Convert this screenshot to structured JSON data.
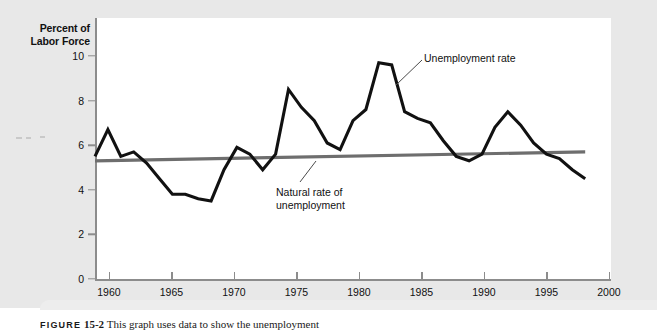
{
  "figure": {
    "y_axis_title_line1": "Percent of",
    "y_axis_title_line2": "Labor Force",
    "caption_lead": "FIGURE",
    "caption_number": "15-2",
    "caption_text": "This graph uses data to show the unemployment"
  },
  "annotations": {
    "unemployment_rate": "Unemployment rate",
    "natural_rate_line1": "Natural rate of",
    "natural_rate_line2": "unemployment"
  },
  "chart_data": {
    "type": "line",
    "title": "",
    "xlabel": "",
    "ylabel": "Percent of Labor Force",
    "xlim": [
      1960,
      2000
    ],
    "ylim": [
      0,
      11
    ],
    "xticks": [
      1960,
      1965,
      1970,
      1975,
      1980,
      1985,
      1990,
      1995,
      2000
    ],
    "yticks": [
      0,
      2,
      4,
      6,
      8,
      10
    ],
    "grid": false,
    "legend": "none",
    "colors": {
      "unemployment_line": "#111111",
      "natural_rate_line": "#6e6e6e",
      "axis": "#8c8c8c",
      "plot_background": "#ffffff",
      "page_background": "#e8e8e8"
    },
    "series": [
      {
        "name": "Unemployment rate",
        "color": "#111111",
        "x": [
          1960,
          1961,
          1962,
          1963,
          1964,
          1965,
          1966,
          1967,
          1968,
          1969,
          1970,
          1971,
          1972,
          1973,
          1974,
          1975,
          1976,
          1977,
          1978,
          1979,
          1980,
          1981,
          1982,
          1983,
          1984,
          1985,
          1986,
          1987,
          1988,
          1989,
          1990,
          1991,
          1992,
          1993,
          1994,
          1995,
          1996,
          1997,
          1998
        ],
        "values": [
          5.5,
          6.7,
          5.5,
          5.7,
          5.2,
          4.5,
          3.8,
          3.8,
          3.6,
          3.5,
          4.9,
          5.9,
          5.6,
          4.9,
          5.6,
          8.5,
          7.7,
          7.1,
          6.1,
          5.8,
          7.1,
          7.6,
          9.7,
          9.6,
          7.5,
          7.2,
          7.0,
          6.2,
          5.5,
          5.3,
          5.6,
          6.8,
          7.5,
          6.9,
          6.1,
          5.6,
          5.4,
          4.9,
          4.5
        ]
      },
      {
        "name": "Natural rate of unemployment",
        "color": "#6e6e6e",
        "x": [
          1960,
          1998
        ],
        "values": [
          5.3,
          5.7
        ]
      }
    ]
  }
}
